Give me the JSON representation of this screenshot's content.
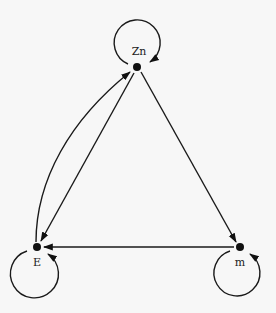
{
  "diagram": {
    "type": "directed-graph",
    "nodes": [
      {
        "id": "Zn",
        "label": "Zn"
      },
      {
        "id": "E",
        "label": "E"
      },
      {
        "id": "m",
        "label": "m"
      }
    ],
    "edges": [
      {
        "from": "Zn",
        "to": "Zn",
        "kind": "self-loop"
      },
      {
        "from": "E",
        "to": "E",
        "kind": "self-loop"
      },
      {
        "from": "m",
        "to": "m",
        "kind": "self-loop"
      },
      {
        "from": "E",
        "to": "Zn",
        "kind": "curved"
      },
      {
        "from": "Zn",
        "to": "E",
        "kind": "straight"
      },
      {
        "from": "Zn",
        "to": "m",
        "kind": "straight"
      },
      {
        "from": "m",
        "to": "E",
        "kind": "straight"
      }
    ]
  },
  "labels": {
    "zn": "Zn",
    "e": "E",
    "m": "m"
  },
  "colors": {
    "ink": "#111111",
    "background": "#f7f7f7"
  }
}
